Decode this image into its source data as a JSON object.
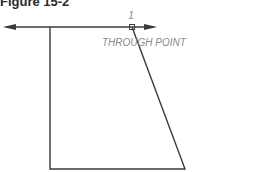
{
  "figure": {
    "title": "Figure 15-2",
    "point_label": "1",
    "point_caption": "THROUGH POINT"
  },
  "colors": {
    "line": "#3a3a3a",
    "text": "#8a8a8a",
    "background": "#ffffff"
  }
}
